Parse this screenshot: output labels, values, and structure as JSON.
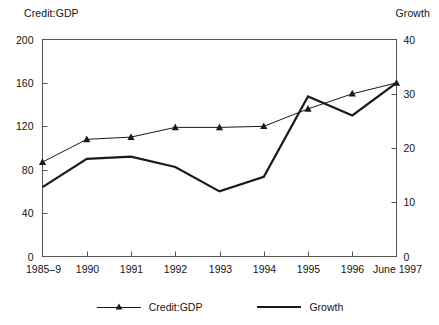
{
  "chart_data": {
    "type": "line",
    "title": "",
    "categories": [
      "1985–9",
      "1990",
      "1991",
      "1992",
      "1993",
      "1994",
      "1995",
      "1996",
      "June 1997"
    ],
    "series": [
      {
        "name": "Credit:GDP",
        "axis": "left",
        "marker": "triangle",
        "line_width": 1,
        "color": "#1a1a1a",
        "values": [
          87,
          108,
          110,
          119,
          119,
          120,
          136,
          150,
          160
        ]
      },
      {
        "name": "Growth",
        "axis": "right",
        "marker": "none",
        "line_width": 2.2,
        "color": "#1a1a1a",
        "values": [
          12.8,
          18.0,
          18.4,
          16.5,
          12.0,
          14.7,
          29.5,
          26.0,
          32.0
        ]
      }
    ],
    "left_axis": {
      "label": "Credit:GDP",
      "ticks": [
        0,
        40,
        80,
        120,
        160,
        200
      ],
      "tick_labels": [
        "0",
        "40",
        "80",
        "120",
        "160",
        "200"
      ],
      "ylim": [
        0,
        200
      ]
    },
    "right_axis": {
      "label": "Growth",
      "ticks": [
        0,
        10,
        20,
        30,
        40
      ],
      "tick_labels": [
        "0",
        "10",
        "20",
        "30",
        "40"
      ],
      "ylim": [
        0,
        40
      ]
    },
    "xlabel": "",
    "grid": false,
    "legend": {
      "position": "bottom",
      "entries": [
        "Credit:GDP",
        "Growth"
      ]
    }
  },
  "legend": {
    "items": [
      {
        "label": "Credit:GDP",
        "marker": "triangle-line-marker"
      },
      {
        "label": "Growth",
        "marker": "thick-line-marker"
      }
    ]
  },
  "colors": {
    "ink": "#1a1a1a",
    "axis": "#555555",
    "background": "#ffffff"
  }
}
